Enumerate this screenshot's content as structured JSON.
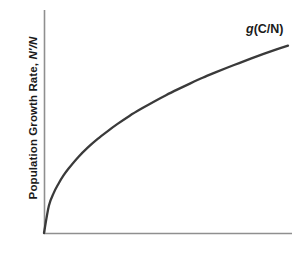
{
  "figure": {
    "background_color": "#ffffff",
    "axis_color": "#8f8f8f",
    "curve_color": "#3a3a3a",
    "text_color": "#1a1a1a"
  },
  "labels": {
    "ylabel_plain": "Population Growth Rate, ",
    "ylabel_italic": "N′/N",
    "ylabel_full": "Population Growth Rate, N′/N",
    "curve_label_italic": "g",
    "curve_label_plain": "(C/N)",
    "curve_label_full": "g(C/N)",
    "xlabel": ""
  },
  "chart_data": {
    "type": "line",
    "title": "",
    "xlabel": "",
    "ylabel": "Population Growth Rate, N′/N",
    "annotations": [
      {
        "text": "g(C/N)",
        "x": 0.82,
        "y": 0.93,
        "style": "italic-g"
      }
    ],
    "legend": null,
    "grid": false,
    "axis_ticks": false,
    "xlim": [
      0,
      1
    ],
    "ylim": [
      0,
      1
    ],
    "series": [
      {
        "name": "g(C/N)",
        "description": "Concave increasing saturating curve through the origin",
        "x": [
          0.0,
          0.02,
          0.04,
          0.06,
          0.08,
          0.1,
          0.14,
          0.18,
          0.22,
          0.26,
          0.3,
          0.35,
          0.4,
          0.45,
          0.5,
          0.55,
          0.6,
          0.65,
          0.7,
          0.75,
          0.8,
          0.85,
          0.9,
          0.95,
          1.0
        ],
        "y": [
          0.0,
          0.122,
          0.18,
          0.222,
          0.258,
          0.288,
          0.34,
          0.384,
          0.422,
          0.456,
          0.488,
          0.525,
          0.558,
          0.589,
          0.618,
          0.645,
          0.671,
          0.696,
          0.719,
          0.741,
          0.762,
          0.783,
          0.803,
          0.822,
          0.84
        ]
      }
    ]
  },
  "geometry": {
    "origin_x": 44,
    "origin_y": 233,
    "y_axis_top": 10,
    "x_axis_right": 292,
    "curve_end_x": 288,
    "curve_end_y": 47
  }
}
